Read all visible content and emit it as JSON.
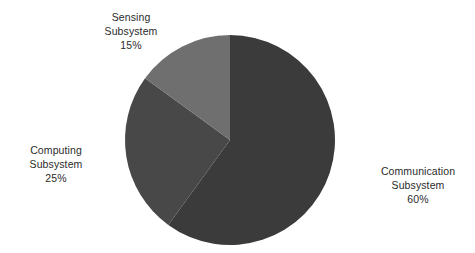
{
  "chart_data": {
    "type": "pie",
    "title": "",
    "subtitle": "",
    "xlabel": "",
    "ylabel": "",
    "legend_position": "none",
    "grid": false,
    "start_angle_deg": 0,
    "direction": "clockwise",
    "units": "percent",
    "categories": [
      "Communication Subsystem",
      "Computing Subsystem",
      "Sensing Subsystem"
    ],
    "values": [
      60,
      25,
      15
    ],
    "slices": [
      {
        "key": "communication",
        "name": "Communication",
        "subsystem": "Subsystem",
        "value": 60,
        "value_label": "60%",
        "color": "#3b3b3b",
        "start_angle_deg": 0,
        "end_angle_deg": 216,
        "sweep_deg": 216,
        "label_position": "right"
      },
      {
        "key": "computing",
        "name": "Computing",
        "subsystem": "Subsystem",
        "value": 25,
        "value_label": "25%",
        "color": "#484848",
        "start_angle_deg": 216,
        "end_angle_deg": 306,
        "sweep_deg": 90,
        "label_position": "left"
      },
      {
        "key": "sensing",
        "name": "Sensing",
        "subsystem": "Subsystem",
        "value": 15,
        "value_label": "15%",
        "color": "#6f6f6f",
        "start_angle_deg": 306,
        "end_angle_deg": 360,
        "sweep_deg": 54,
        "label_position": "top-left"
      }
    ],
    "geometry": {
      "center_x": 230,
      "center_y": 140,
      "radius": 105
    },
    "colors": {
      "background": "#ffffff",
      "text": "#2b2b2b",
      "communication": "#3b3b3b",
      "computing": "#484848",
      "sensing": "#6f6f6f"
    }
  },
  "labels": {
    "sensing": {
      "name": "Sensing",
      "subsystem": "Subsystem",
      "value_label": "15%"
    },
    "computing": {
      "name": "Computing",
      "subsystem": "Subsystem",
      "value_label": "25%"
    },
    "communication": {
      "name": "Communication",
      "subsystem": "Subsystem",
      "value_label": "60%"
    }
  }
}
